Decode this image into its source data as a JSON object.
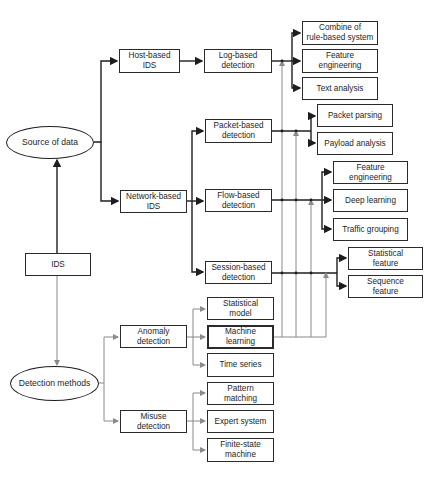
{
  "figure": {
    "root": "IDS",
    "categories": {
      "source": "Source of data",
      "detection": "Detection methods"
    },
    "nodes": {
      "host_ids": "Host-based\nIDS",
      "network_ids": "Network-based\nIDS",
      "log_detection": "Log-based\ndetection",
      "packet_detection": "Packet-based\ndetection",
      "flow_detection": "Flow-based\ndetection",
      "session_detection": "Session-based\ndetection",
      "anomaly_detection": "Anomaly\ndetection",
      "misuse_detection": "Misuse\ndetection",
      "combine_rule": "Combine of\nrule-based system",
      "feature_eng_log": "Feature\nengineering",
      "text_analysis": "Text analysis",
      "packet_parsing": "Packet parsing",
      "payload_analysis": "Payload analysis",
      "feature_eng_flow": "Feature\nengineering",
      "deep_learning": "Deep learning",
      "traffic_grouping": "Traffic grouping",
      "statistical_feature": "Statistical\nfeature",
      "sequence_feature": "Sequence\nfeature",
      "statistical_model": "Statistical\nmodel",
      "machine_learning": "Machine\nlearning",
      "time_series": "Time series",
      "pattern_matching": "Pattern\nmatching",
      "expert_system": "Expert system",
      "finite_state": "Finite-state\nmachine"
    }
  },
  "colors": {
    "line": "#1e1e1e",
    "thin_line": "#9a9a9a",
    "background": "#ffffff"
  }
}
